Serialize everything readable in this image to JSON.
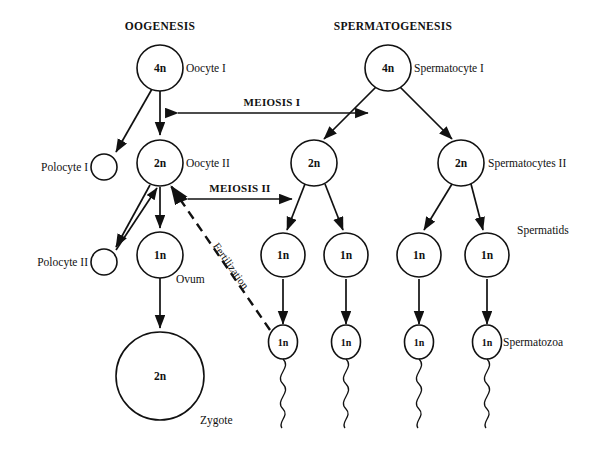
{
  "diagram": {
    "headings": {
      "left": "OOGENESIS",
      "right": "SPERMATOGENESIS"
    },
    "stage_labels": {
      "meiosis_1": "MEIOSIS I",
      "meiosis_2": "MEIOSIS II",
      "fertilization": "Fertilization"
    },
    "cells": [
      {
        "id": "oocyte-1",
        "ploidy": "4n",
        "label": "Oocyte I",
        "cx": 160,
        "cy": 68,
        "r": 23
      },
      {
        "id": "spermatocyte-1",
        "ploidy": "4n",
        "label": "Spermatocyte I",
        "cx": 388,
        "cy": 68,
        "r": 23
      },
      {
        "id": "polocyte-1",
        "ploidy": "",
        "label": "Polocyte I",
        "cx": 104,
        "cy": 167,
        "r": 13
      },
      {
        "id": "oocyte-2",
        "ploidy": "2n",
        "label": "Oocyte II",
        "cx": 160,
        "cy": 163,
        "r": 23
      },
      {
        "id": "spermatocyte-2a",
        "ploidy": "2n",
        "label": "",
        "cx": 314,
        "cy": 163,
        "r": 23
      },
      {
        "id": "spermatocyte-2b",
        "ploidy": "2n",
        "label": "Spermatocytes II",
        "cx": 461,
        "cy": 163,
        "r": 23
      },
      {
        "id": "polocyte-2",
        "ploidy": "",
        "label": "Polocyte II",
        "cx": 104,
        "cy": 262,
        "r": 13
      },
      {
        "id": "ovum",
        "ploidy": "1n",
        "label": "Ovum",
        "cx": 160,
        "cy": 255,
        "r": 23
      },
      {
        "id": "spermatid-1",
        "ploidy": "1n",
        "label": "",
        "cx": 283,
        "cy": 255,
        "r": 22
      },
      {
        "id": "spermatid-2",
        "ploidy": "1n",
        "label": "",
        "cx": 346,
        "cy": 255,
        "r": 22
      },
      {
        "id": "spermatid-3",
        "ploidy": "1n",
        "label": "",
        "cx": 419,
        "cy": 255,
        "r": 22
      },
      {
        "id": "spermatid-4",
        "ploidy": "1n",
        "label": "Spermatids",
        "cx": 487,
        "cy": 255,
        "r": 22
      },
      {
        "id": "zygote",
        "ploidy": "2n",
        "label": "Zygote",
        "cx": 160,
        "cy": 376,
        "r": 44
      }
    ],
    "spermatozoa": [
      {
        "id": "spermatozoon-1",
        "ploidy": "1n",
        "label": "",
        "cx": 283,
        "cy": 342
      },
      {
        "id": "spermatozoon-2",
        "ploidy": "1n",
        "label": "",
        "cx": 346,
        "cy": 342
      },
      {
        "id": "spermatozoon-3",
        "ploidy": "1n",
        "label": "",
        "cx": 419,
        "cy": 342
      },
      {
        "id": "spermatozoon-4",
        "ploidy": "1n",
        "label": "Spermatozoa",
        "cx": 487,
        "cy": 342
      }
    ]
  }
}
